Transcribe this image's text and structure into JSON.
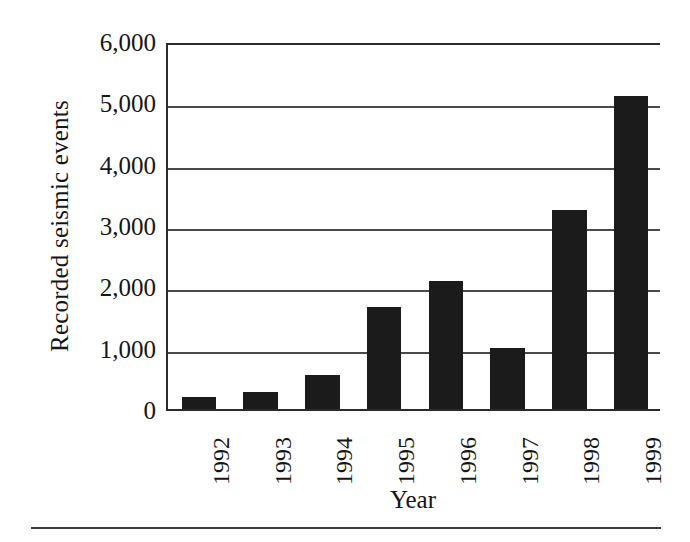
{
  "chart_data": {
    "type": "bar",
    "title": "",
    "subtitle": "",
    "xlabel": "Year",
    "ylabel": "Recorded seismic events",
    "categories": [
      "1992",
      "1993",
      "1994",
      "1995",
      "1996",
      "1997",
      "1998",
      "1999"
    ],
    "values": [
      200,
      280,
      550,
      1660,
      2080,
      1000,
      3250,
      5100
    ],
    "series": [
      {
        "name": "Recorded seismic events",
        "values": [
          200,
          280,
          550,
          1660,
          2080,
          1000,
          3250,
          5100
        ]
      }
    ],
    "ylim": [
      0,
      6000
    ],
    "ytick_values": [
      0,
      1000,
      2000,
      3000,
      4000,
      5000,
      6000
    ],
    "ytick_labels": [
      "0",
      "1,000",
      "2,000",
      "3,000",
      "4,000",
      "5,000",
      "6,000"
    ],
    "xtick_labels": [
      "1992",
      "1993",
      "1994",
      "1995",
      "1996",
      "1997",
      "1998",
      "1999"
    ],
    "xtick_rotation": 90,
    "grid": "horizontal",
    "legend": "none",
    "bar_color": "#1b1b1b",
    "axis_color": "#2b2b2b",
    "gridline_color": "#4a4a4a",
    "background_color": "#ffffff"
  },
  "figure": {
    "y_axis_title": "Recorded seismic events",
    "x_axis_title": "Year"
  }
}
